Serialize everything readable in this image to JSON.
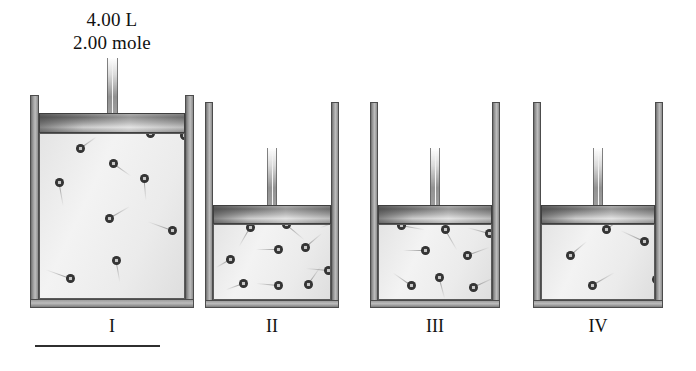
{
  "figure": {
    "title_lines": [
      "4.00 L",
      "2.00 mole"
    ],
    "volume_label": "4.00 L",
    "moles_label": "2.00 mole"
  },
  "colors": {
    "background": "#ffffff",
    "wall": "#9a9a9a",
    "wall_outline": "#4c4c4c",
    "gas": "#ebebeb",
    "piston": "#8b8b8b",
    "particle": "#2e2e2e",
    "text": "#111111",
    "rule": "#2f2f2f"
  },
  "containers": [
    {
      "id": "container-1",
      "label": "I",
      "particle_count": 10,
      "geometry": {
        "left": 30,
        "top": 95,
        "width": 164,
        "height": 213,
        "piston_top": 113,
        "piston_height": 20,
        "wall_thickness": 9,
        "rod_top": 58,
        "rod_width": 11
      },
      "particles": [
        {
          "x": 36,
          "y": 48,
          "angle": -35,
          "trail": 20
        },
        {
          "x": 106,
          "y": 33,
          "angle": -20,
          "trail": 18
        },
        {
          "x": 140,
          "y": 35,
          "angle": -45,
          "trail": 16
        },
        {
          "x": 69,
          "y": 63,
          "angle": 35,
          "trail": 22
        },
        {
          "x": 15,
          "y": 82,
          "angle": 80,
          "trail": 24
        },
        {
          "x": 100,
          "y": 78,
          "angle": 85,
          "trail": 22
        },
        {
          "x": 65,
          "y": 118,
          "angle": -30,
          "trail": 24
        },
        {
          "x": 128,
          "y": 130,
          "angle": 200,
          "trail": 26
        },
        {
          "x": 72,
          "y": 160,
          "angle": 80,
          "trail": 22
        },
        {
          "x": 26,
          "y": 178,
          "angle": 200,
          "trail": 26
        }
      ]
    },
    {
      "id": "container-2",
      "label": "II",
      "particle_count": 10,
      "geometry": {
        "left": 205,
        "top": 102,
        "width": 134,
        "height": 206,
        "piston_top": 205,
        "piston_height": 19,
        "wall_thickness": 8,
        "rod_top": 148,
        "rod_width": 10
      },
      "particles": [
        {
          "x": 32,
          "y": 120,
          "angle": 120,
          "trail": 22
        },
        {
          "x": 68,
          "y": 117,
          "angle": 40,
          "trail": 24
        },
        {
          "x": 119,
          "y": 114,
          "angle": 160,
          "trail": 18
        },
        {
          "x": 60,
          "y": 142,
          "angle": 180,
          "trail": 22
        },
        {
          "x": 87,
          "y": 140,
          "angle": -40,
          "trail": 22
        },
        {
          "x": 12,
          "y": 152,
          "angle": 150,
          "trail": 16
        },
        {
          "x": 110,
          "y": 163,
          "angle": 185,
          "trail": 22
        },
        {
          "x": 25,
          "y": 176,
          "angle": 160,
          "trail": 18
        },
        {
          "x": 60,
          "y": 178,
          "angle": 185,
          "trail": 22
        },
        {
          "x": 90,
          "y": 177,
          "angle": -55,
          "trail": 22
        }
      ]
    },
    {
      "id": "container-3",
      "label": "III",
      "particle_count": 8,
      "geometry": {
        "left": 370,
        "top": 102,
        "width": 130,
        "height": 206,
        "piston_top": 205,
        "piston_height": 19,
        "wall_thickness": 8,
        "rod_top": 148,
        "rod_width": 10
      },
      "particles": [
        {
          "x": 18,
          "y": 118,
          "angle": 10,
          "trail": 24
        },
        {
          "x": 62,
          "y": 122,
          "angle": 60,
          "trail": 24
        },
        {
          "x": 106,
          "y": 126,
          "angle": 195,
          "trail": 22
        },
        {
          "x": 42,
          "y": 143,
          "angle": 180,
          "trail": 22
        },
        {
          "x": 84,
          "y": 148,
          "angle": -20,
          "trail": 24
        },
        {
          "x": 56,
          "y": 170,
          "angle": 75,
          "trail": 22
        },
        {
          "x": 28,
          "y": 178,
          "angle": 215,
          "trail": 22
        },
        {
          "x": 90,
          "y": 180,
          "angle": -25,
          "trail": 24
        }
      ]
    },
    {
      "id": "container-4",
      "label": "IV",
      "particle_count": 5,
      "geometry": {
        "left": 533,
        "top": 102,
        "width": 130,
        "height": 206,
        "piston_top": 205,
        "piston_height": 19,
        "wall_thickness": 8,
        "rod_top": 148,
        "rod_width": 10
      },
      "particles": [
        {
          "x": 60,
          "y": 122,
          "angle": -35,
          "trail": 26
        },
        {
          "x": 98,
          "y": 134,
          "angle": 205,
          "trail": 26
        },
        {
          "x": 24,
          "y": 148,
          "angle": -40,
          "trail": 22
        },
        {
          "x": 46,
          "y": 178,
          "angle": -30,
          "trail": 26
        },
        {
          "x": 110,
          "y": 172,
          "angle": 80,
          "trail": 24
        }
      ]
    }
  ],
  "rule": {
    "left": 35,
    "top": 345,
    "width": 125
  }
}
